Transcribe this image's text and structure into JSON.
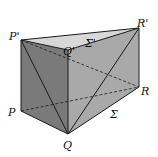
{
  "figure": {
    "vertices": {
      "P_top": "P'",
      "Q_top": "Q'",
      "R_top": "R'",
      "P": "P",
      "Q": "Q",
      "R": "R"
    },
    "faces": {
      "top": "Σ'",
      "bottom": "Σ"
    },
    "colors": {
      "top_face": "#d8d8d8",
      "left_face": "#7a7a7a",
      "right_face": "#a9a9a9",
      "edge": "#1a1a1a"
    }
  }
}
